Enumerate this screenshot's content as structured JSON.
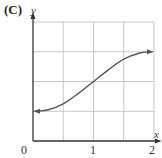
{
  "panel_label": "(C)",
  "chart_data": {
    "type": "line",
    "title": "",
    "xlabel": "x",
    "ylabel": "y",
    "xlim": [
      0,
      2
    ],
    "ylim": [
      0,
      4
    ],
    "x_ticks": [
      0,
      0.5,
      1,
      1.5,
      2
    ],
    "x_tick_labels": [
      "0",
      "1",
      "2"
    ],
    "x_tick_label_positions": [
      0,
      1,
      2
    ],
    "y_ticks_gridlines": [
      1,
      2,
      3,
      4
    ],
    "y_tick_labels": [],
    "grid": true,
    "legend": null,
    "series": [
      {
        "name": "sigmoid curve",
        "color": "#555555",
        "arrows_both_ends": true,
        "x": [
          0.05,
          0.25,
          0.5,
          0.75,
          1.0,
          1.25,
          1.5,
          1.75,
          1.95
        ],
        "y": [
          1.0,
          1.05,
          1.25,
          1.6,
          2.0,
          2.4,
          2.75,
          2.95,
          3.0
        ]
      }
    ]
  },
  "colors": {
    "axis": "#333333",
    "grid": "#c8c8c8",
    "curve": "#555555"
  }
}
